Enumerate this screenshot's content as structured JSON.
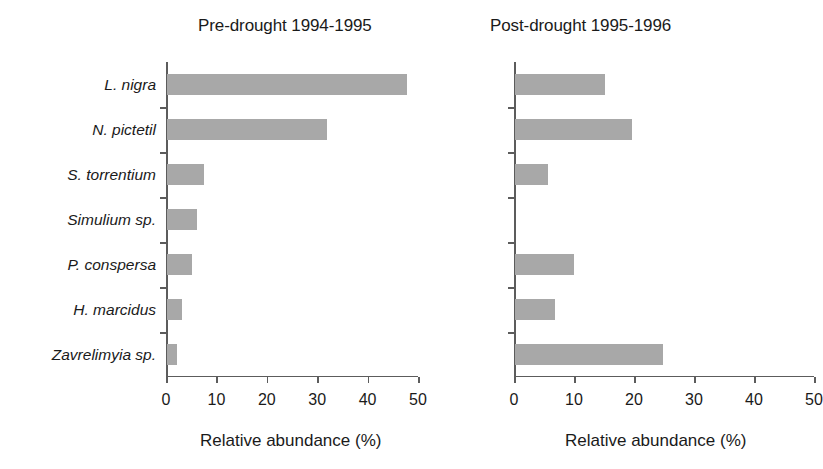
{
  "figure": {
    "axis_title": "Relative abundance (%)",
    "bar_color": "#a8a8a8",
    "axis_color": "#5c5c5c"
  },
  "chart_data": {
    "type": "bar",
    "title": "",
    "orientation": "horizontal",
    "xlabel": "Relative abundance (%)",
    "ylabel": "",
    "xlim": [
      0,
      50
    ],
    "xticks": [
      0,
      10,
      20,
      30,
      40,
      50
    ],
    "xtick_labels": [
      "0",
      "10",
      "20",
      "30",
      "40",
      "50"
    ],
    "grid": false,
    "legend": null,
    "categories": [
      "L. nigra",
      "N. pictetil",
      "S. torrentium",
      "Simulium sp.",
      "P. conspersa",
      "H. marcidus",
      "Zavrelimyia sp."
    ],
    "panels": [
      {
        "title": "Pre-drought 1994-1995",
        "values": [
          47.6,
          31.7,
          7.4,
          6.0,
          5.0,
          3.0,
          2.0
        ]
      },
      {
        "title": "Post-drought 1995-1996",
        "values": [
          15.0,
          19.5,
          5.5,
          0,
          9.8,
          6.6,
          24.6
        ]
      }
    ]
  }
}
